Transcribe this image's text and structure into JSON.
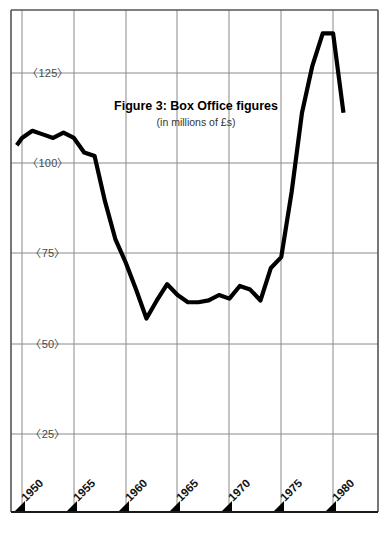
{
  "chart_data": {
    "type": "line",
    "title": "Figure 3: Box Office figures",
    "subtitle": "(in millions of £s)",
    "xlabel": "",
    "ylabel": "",
    "xlim": [
      1949,
      1981.6
    ],
    "ylim": [
      0,
      150
    ],
    "grid": true,
    "legend": false,
    "legend_position": "none",
    "line_color": "#000000",
    "grid_color": "#8a8a8a",
    "axis_color": "#333333",
    "background_color": "#ffffff",
    "x_ticks": [
      "1950",
      "1955",
      "1960",
      "1965",
      "1970",
      "1975",
      "1980"
    ],
    "x_tick_values": [
      1950,
      1955,
      1960,
      1965,
      1970,
      1975,
      1980
    ],
    "y_ticks": [
      "25",
      "50",
      "75",
      "100",
      "125"
    ],
    "y_tick_values": [
      25,
      50,
      75,
      100,
      125
    ],
    "y_tick_label_format": "〈{v}〉",
    "series": [
      {
        "name": "Box Office figures",
        "x": [
          1949.5,
          1950,
          1951,
          1952,
          1953,
          1954,
          1955,
          1956,
          1957,
          1958,
          1959,
          1960,
          1961,
          1962,
          1963,
          1964,
          1965,
          1966,
          1967,
          1968,
          1969,
          1970,
          1971,
          1972,
          1973,
          1974,
          1975,
          1976,
          1977,
          1978,
          1979,
          1980,
          1981
        ],
        "values": [
          105,
          107,
          109,
          108,
          107,
          108.5,
          107,
          103,
          102,
          89.5,
          79,
          72.5,
          65,
          57,
          62,
          66.5,
          63.5,
          61.5,
          61.5,
          62,
          63.5,
          62.5,
          66,
          65,
          62,
          71,
          74,
          92,
          114,
          127,
          136,
          136,
          114
        ]
      }
    ],
    "annotations": []
  },
  "figure": {
    "caption_main": "Figure 3: Box Office figures",
    "caption_sub": "(in millions of £s)"
  },
  "axes": {
    "y_labels": [
      {
        "text": "〈125〉",
        "value": 125
      },
      {
        "text": "〈100〉",
        "value": 100
      },
      {
        "text": "〈75〉",
        "value": 75
      },
      {
        "text": "〈50〉",
        "value": 50
      },
      {
        "text": "〈25〉",
        "value": 25
      }
    ],
    "x_labels": [
      {
        "text": "1950",
        "value": 1950
      },
      {
        "text": "1955",
        "value": 1955
      },
      {
        "text": "1960",
        "value": 1960
      },
      {
        "text": "1965",
        "value": 1965
      },
      {
        "text": "1970",
        "value": 1970
      },
      {
        "text": "1975",
        "value": 1975
      },
      {
        "text": "1980",
        "value": 1980
      }
    ]
  }
}
